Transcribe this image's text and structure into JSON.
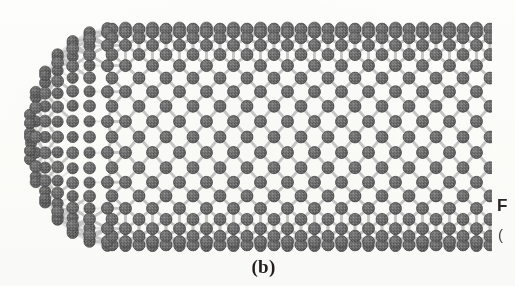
{
  "figure": {
    "label": "(b)",
    "geometry": {
      "tube_left_px": 28,
      "tube_right_px": 492,
      "tube_top_px": 28,
      "tube_bottom_px": 246,
      "cap_center_x_px": 112,
      "cap_radius_x_px": 84,
      "atom_diameter_px": 12,
      "hex_width_px": 27,
      "hex_vertical_period_px": 24,
      "rings_across_tube": 9,
      "rings_along_tube": 14
    }
  },
  "colors": {
    "background": "#fdfdfc",
    "atom_fill": "#6e6e6e",
    "atom_fill_dark": "#565656",
    "atom_edge": "#4a4a4a",
    "atom_highlight": "#a8a8a8",
    "bond": "#c2c2c2",
    "bond_back": "#d6d6d6",
    "text": "#231f20"
  },
  "caption_fragment": {
    "line1": "F",
    "line2": "("
  }
}
